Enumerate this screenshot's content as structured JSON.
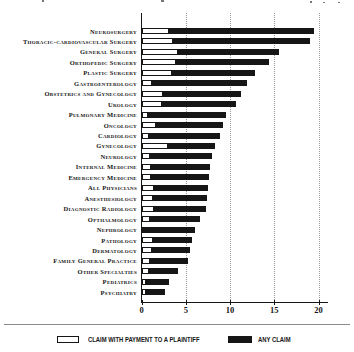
{
  "chart_data": {
    "type": "bar",
    "orientation": "horizontal",
    "title": "",
    "xlabel": "",
    "ylabel": "",
    "xlim": [
      0,
      21
    ],
    "x_ticks": [
      0,
      5,
      10,
      15,
      20
    ],
    "grid": "vertical-dotted",
    "legend_position": "bottom",
    "categories": [
      "Neurosurgery",
      "Thoracic-cardiovascular Surgery",
      "General Surgery",
      "Orthopedic Surgery",
      "Plastic Surgery",
      "Gastroenterology",
      "Obstetrics and Gynecology",
      "Urology",
      "Pulmonary Medicine",
      "Oncology",
      "Cardiology",
      "Gynecology",
      "Neurology",
      "Internal Medicine",
      "Emergency Medicine",
      "All Physicians",
      "Anesthesiology",
      "Diagnostic Radiology",
      "Opthalmology",
      "Nephrology",
      "Pathology",
      "Dermatology",
      "Family General Practice",
      "Other Specialties",
      "Pediatrics",
      "Psychiatry"
    ],
    "series": [
      {
        "name": "CLAIM WITH PAYMENT TO A PLAINTIFF",
        "swatch_color": "#ffffff",
        "values": [
          3.0,
          3.5,
          4.1,
          3.8,
          3.4,
          1.1,
          2.4,
          2.3,
          0.7,
          1.6,
          0.8,
          2.9,
          0.9,
          1.0,
          1.0,
          1.4,
          1.2,
          1.4,
          0.9,
          0.2,
          1.2,
          1.1,
          0.9,
          0.8,
          0.5,
          0.5
        ]
      },
      {
        "name": "ANY CLAIM",
        "swatch_color": "#161616",
        "values": [
          19.4,
          19.0,
          15.5,
          14.4,
          12.8,
          11.9,
          11.2,
          10.6,
          9.5,
          9.1,
          8.8,
          8.3,
          7.9,
          7.7,
          7.6,
          7.5,
          7.3,
          7.2,
          6.6,
          6.0,
          5.6,
          5.4,
          5.2,
          4.1,
          3.0,
          2.6
        ]
      }
    ],
    "colors": {
      "bar": "#161616",
      "payment_fill": "#ffffff",
      "gridline": "#9a9a9a",
      "axis": "#161616"
    }
  },
  "axis": {
    "tick_labels": [
      "0",
      "5",
      "10",
      "15",
      "20"
    ]
  },
  "legend": {
    "items": [
      {
        "label": "CLAIM WITH PAYMENT TO A PLAINTIFF",
        "swatch": "white-outlined"
      },
      {
        "label": "ANY CLAIM",
        "swatch": "black"
      }
    ]
  }
}
